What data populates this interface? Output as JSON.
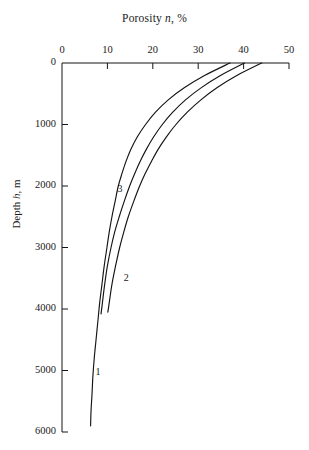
{
  "chart_data": {
    "type": "line",
    "title": "Porosity n, %",
    "title_parts": {
      "pre": "Porosity ",
      "symbol": "n",
      "post": ", %"
    },
    "xlabel": "Porosity n, %",
    "ylabel": "Depth h, m",
    "ylabel_parts": {
      "pre": "Depth ",
      "symbol": "h",
      "post": ", m"
    },
    "x_axis_position": "top",
    "y_axis_direction": "inverted",
    "grid": false,
    "legend": "none",
    "xlim": [
      0,
      50
    ],
    "ylim": [
      0,
      6000
    ],
    "xticks": [
      0,
      10,
      20,
      30,
      40,
      50
    ],
    "xtick_labels": [
      "0",
      "10",
      "20",
      "30",
      "40",
      "50"
    ],
    "yticks": [
      0,
      1000,
      2000,
      3000,
      4000,
      5000,
      6000
    ],
    "ytick_labels": [
      "0",
      "1000",
      "2000",
      "3000",
      "4000",
      "5000",
      "6000"
    ],
    "series": [
      {
        "name": "1",
        "label": "1",
        "label_x": 7.4,
        "label_y": 5020,
        "points": [
          [
            37.0,
            0
          ],
          [
            31.5,
            200
          ],
          [
            27.0,
            400
          ],
          [
            23.4,
            600
          ],
          [
            20.6,
            800
          ],
          [
            18.4,
            1000
          ],
          [
            16.6,
            1200
          ],
          [
            15.2,
            1400
          ],
          [
            14.1,
            1600
          ],
          [
            13.2,
            1800
          ],
          [
            12.4,
            2000
          ],
          [
            11.7,
            2250
          ],
          [
            11.0,
            2500
          ],
          [
            10.4,
            2750
          ],
          [
            9.9,
            3000
          ],
          [
            9.3,
            3300
          ],
          [
            8.8,
            3600
          ],
          [
            8.3,
            3900
          ],
          [
            7.9,
            4200
          ],
          [
            7.5,
            4500
          ],
          [
            7.1,
            4800
          ],
          [
            6.8,
            5100
          ],
          [
            6.6,
            5400
          ],
          [
            6.4,
            5650
          ],
          [
            6.3,
            5900
          ]
        ]
      },
      {
        "name": "2",
        "label": "2",
        "label_x": 13.6,
        "label_y": 3490,
        "points": [
          [
            44.0,
            0
          ],
          [
            38.6,
            200
          ],
          [
            34.2,
            400
          ],
          [
            30.6,
            600
          ],
          [
            27.6,
            800
          ],
          [
            25.1,
            1000
          ],
          [
            23.0,
            1200
          ],
          [
            21.2,
            1400
          ],
          [
            19.7,
            1600
          ],
          [
            18.3,
            1800
          ],
          [
            17.1,
            2000
          ],
          [
            15.8,
            2250
          ],
          [
            14.6,
            2500
          ],
          [
            13.6,
            2750
          ],
          [
            12.7,
            3000
          ],
          [
            11.8,
            3300
          ],
          [
            11.0,
            3600
          ],
          [
            10.4,
            3900
          ],
          [
            10.1,
            4050
          ]
        ]
      },
      {
        "name": "3",
        "label": "3",
        "label_x": 12.2,
        "label_y": 2050,
        "points": [
          [
            40.2,
            0
          ],
          [
            35.0,
            200
          ],
          [
            30.7,
            400
          ],
          [
            27.2,
            600
          ],
          [
            24.4,
            800
          ],
          [
            22.1,
            1000
          ],
          [
            20.2,
            1200
          ],
          [
            18.6,
            1400
          ],
          [
            17.2,
            1600
          ],
          [
            16.0,
            1800
          ],
          [
            14.9,
            2000
          ],
          [
            13.7,
            2250
          ],
          [
            12.6,
            2500
          ],
          [
            11.6,
            2750
          ],
          [
            10.8,
            3000
          ],
          [
            10.0,
            3300
          ],
          [
            9.4,
            3600
          ],
          [
            8.9,
            3900
          ],
          [
            8.6,
            4080
          ]
        ]
      }
    ]
  }
}
